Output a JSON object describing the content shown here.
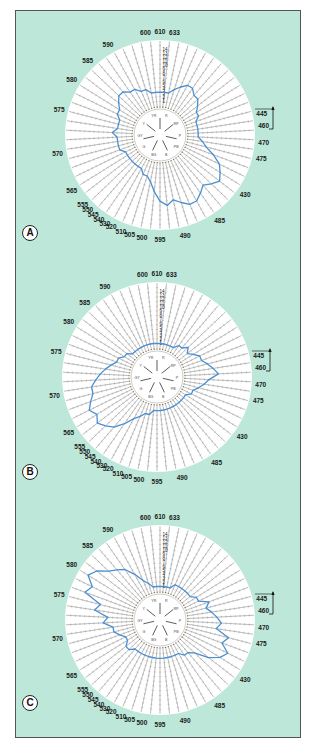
{
  "figure": {
    "background_color": "#bde8d9",
    "curve_color": "#4a8fd0",
    "panels": [
      {
        "id": "A",
        "label": "A"
      },
      {
        "id": "B",
        "label": "B"
      },
      {
        "id": "C",
        "label": "C"
      }
    ]
  },
  "wavelength_labels": [
    {
      "text": "600",
      "angle": -8
    },
    {
      "text": "610",
      "angle": 0
    },
    {
      "text": "633",
      "angle": 8
    },
    {
      "text": "590",
      "angle": -30
    },
    {
      "text": "585",
      "angle": -44
    },
    {
      "text": "580",
      "angle": -58
    },
    {
      "text": "575",
      "angle": -76
    },
    {
      "text": "570",
      "angle": -100
    },
    {
      "text": "565",
      "angle": -122
    },
    {
      "text": "555",
      "angle": -132
    },
    {
      "text": "550",
      "angle": -136
    },
    {
      "text": "545",
      "angle": -140
    },
    {
      "text": "540",
      "angle": -144
    },
    {
      "text": "530",
      "angle": -148
    },
    {
      "text": "520",
      "angle": -152
    },
    {
      "text": "510",
      "angle": -158
    },
    {
      "text": "505",
      "angle": -163
    },
    {
      "text": "500",
      "angle": -170
    },
    {
      "text": "595",
      "angle": 180
    },
    {
      "text": "490",
      "angle": 166
    },
    {
      "text": "485",
      "angle": 145
    },
    {
      "text": "430",
      "angle": 125
    },
    {
      "text": "475",
      "angle": 103
    },
    {
      "text": "470",
      "angle": 94
    },
    {
      "text": "460",
      "angle": 85
    },
    {
      "text": "445",
      "angle": 78
    }
  ],
  "radial_scale": [
    "14",
    "13",
    "12",
    "11",
    "10",
    "9",
    "8",
    "7",
    "6",
    "5",
    "4",
    "3",
    "2",
    "1"
  ],
  "inner_labels": [
    "R",
    "RP",
    "P",
    "PB",
    "B",
    "BG",
    "G",
    "GY",
    "Y",
    "YR"
  ],
  "chart_data": [
    {
      "type": "radar",
      "title": "A",
      "categories_note": "wavelength (nm) around circumference",
      "radial_range": [
        0,
        14
      ],
      "series": [
        {
          "name": "A",
          "profile": [
            3,
            3,
            3,
            4,
            5,
            6,
            6,
            5,
            5,
            4,
            3,
            3,
            2,
            2,
            2,
            2,
            2,
            3,
            4,
            6,
            8,
            9,
            10,
            9,
            8,
            9,
            10,
            10,
            9,
            8,
            9,
            8,
            6,
            4,
            3,
            3,
            2,
            2,
            2,
            2,
            2,
            2,
            2,
            3,
            3,
            3,
            3,
            4,
            3,
            3,
            3,
            4,
            4,
            5,
            6,
            6,
            5,
            5,
            4,
            4,
            3,
            3
          ]
        }
      ]
    },
    {
      "type": "radar",
      "title": "B",
      "radial_range": [
        0,
        14
      ],
      "series": [
        {
          "name": "B",
          "profile": [
            1,
            1,
            1,
            1,
            1,
            1,
            2,
            2,
            3,
            2,
            3,
            4,
            4,
            5,
            6,
            7,
            5,
            4,
            3,
            2,
            2,
            1,
            1,
            1,
            1,
            1,
            1,
            1,
            1,
            1,
            1,
            1,
            1,
            2,
            2,
            3,
            4,
            6,
            8,
            9,
            10,
            9,
            10,
            9,
            8,
            8,
            7,
            6,
            5,
            4,
            3,
            3,
            2,
            2,
            1,
            1,
            1,
            1,
            1,
            1,
            1,
            1
          ]
        }
      ]
    },
    {
      "type": "radar",
      "title": "C",
      "radial_range": [
        0,
        14
      ],
      "series": [
        {
          "name": "C",
          "profile": [
            1,
            1,
            1,
            1,
            2,
            2,
            2,
            2,
            2,
            2,
            3,
            3,
            5,
            4,
            5,
            6,
            7,
            6,
            9,
            8,
            10,
            9,
            7,
            4,
            3,
            3,
            2,
            2,
            2,
            2,
            2,
            2,
            2,
            2,
            2,
            2,
            2,
            2,
            2,
            3,
            3,
            2,
            2,
            3,
            4,
            4,
            6,
            5,
            8,
            7,
            11,
            10,
            12,
            11,
            9,
            8,
            7,
            5,
            3,
            2,
            1,
            1
          ]
        }
      ]
    }
  ]
}
